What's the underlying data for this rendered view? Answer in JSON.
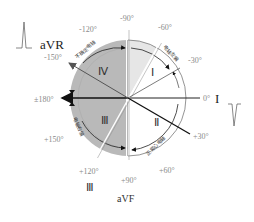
{
  "diagram": {
    "center": {
      "x": 128,
      "y": 98
    },
    "radius": 58,
    "colors": {
      "left_half": "#b9b9b9",
      "upper_right_wedge": "#e6e6e6",
      "right_half": "#ffffff",
      "axis_line": "#222222",
      "label_gray": "#8a8a8a"
    },
    "angle_labels": [
      {
        "id": "m90",
        "text": "-90°"
      },
      {
        "id": "m60",
        "text": "-60°"
      },
      {
        "id": "m30",
        "text": "-30°"
      },
      {
        "id": "zero",
        "text": "0°"
      },
      {
        "id": "p30",
        "text": "+30°"
      },
      {
        "id": "p60",
        "text": "+60°"
      },
      {
        "id": "p90",
        "text": "+90°"
      },
      {
        "id": "p120",
        "text": "+120°"
      },
      {
        "id": "p150",
        "text": "+150°"
      },
      {
        "id": "p180",
        "text": "±180°"
      },
      {
        "id": "m150",
        "text": "-150°"
      },
      {
        "id": "m120",
        "text": "-120°"
      }
    ],
    "leads": {
      "aVR": "aVR",
      "I": "I",
      "aVF": "aVF",
      "III": "Ⅲ"
    },
    "quadrants": {
      "I": "Ⅰ",
      "II": "Ⅱ",
      "III": "Ⅲ",
      "IV": "Ⅳ"
    },
    "region_labels": {
      "indeterminate": "不确定电轴",
      "left_deviation": "电轴左偏",
      "right_deviation": "电轴右偏",
      "normal": "正常心电轴"
    }
  }
}
